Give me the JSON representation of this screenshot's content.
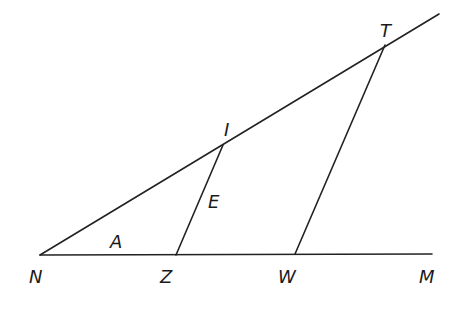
{
  "diagram": {
    "type": "geometry",
    "stroke_color": "#222222",
    "points": {
      "N": {
        "label": "N",
        "x": 40,
        "y": 255,
        "label_x": 29,
        "label_y": 283
      },
      "Z": {
        "label": "Z",
        "x": 176,
        "y": 255,
        "label_x": 160,
        "label_y": 283
      },
      "W": {
        "label": "W",
        "x": 295,
        "y": 254,
        "label_x": 278,
        "label_y": 283
      },
      "M": {
        "label": "M",
        "x": 432,
        "y": 254,
        "label_x": 419,
        "label_y": 283
      },
      "I": {
        "label": "I",
        "x": 223,
        "y": 145,
        "label_x": 224,
        "label_y": 136
      },
      "T": {
        "label": "T",
        "x": 385,
        "y": 45,
        "label_x": 380,
        "label_y": 37
      }
    },
    "ray_end": {
      "x": 439,
      "y": 14
    },
    "segments": [
      {
        "from": "N",
        "to": "M",
        "name": "line-NM"
      },
      {
        "from": "N",
        "to": "ray_end",
        "name": "ray-NT"
      },
      {
        "from": "Z",
        "to": "I",
        "name": "segment-ZI"
      },
      {
        "from": "W",
        "to": "T",
        "name": "segment-WT"
      }
    ],
    "region_labels": {
      "A": {
        "text": "A",
        "x": 110,
        "y": 248
      },
      "E": {
        "text": "E",
        "x": 208,
        "y": 208
      }
    }
  }
}
